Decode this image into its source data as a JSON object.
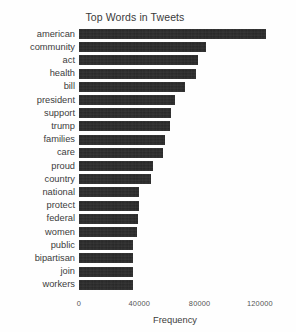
{
  "chart_data": {
    "type": "bar",
    "orientation": "horizontal",
    "title": "Top Words in Tweets",
    "xlabel": "Frequency",
    "ylabel": "",
    "categories": [
      "american",
      "community",
      "act",
      "health",
      "bill",
      "president",
      "support",
      "trump",
      "families",
      "care",
      "proud",
      "country",
      "national",
      "protect",
      "federal",
      "women",
      "public",
      "bipartisan",
      "join",
      "workers"
    ],
    "values": [
      124000,
      84000,
      79000,
      77500,
      70000,
      64000,
      61000,
      60500,
      57000,
      56000,
      49000,
      48000,
      40000,
      39500,
      39000,
      38500,
      36000,
      36000,
      35500,
      35500
    ],
    "xlim": [
      0,
      130000
    ],
    "xticks": [
      0,
      40000,
      80000,
      120000
    ],
    "xtick_labels": [
      "0",
      "40000",
      "80000",
      "120000"
    ],
    "grid": false,
    "legend": null,
    "bar_color": "#262626",
    "background_color": "#ffffff",
    "text_color": "#3c3c3c"
  }
}
